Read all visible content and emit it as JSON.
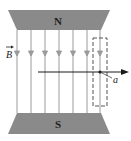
{
  "diagram": {
    "north_pole_label": "N",
    "south_pole_label": "S",
    "field_label": "B",
    "point_label": "a",
    "field_line_count": 7,
    "field_direction": "down",
    "colors": {
      "pole": "#8a8a8a",
      "field_line": "#9a9a9a",
      "arrow": "#1a1a1a",
      "dashed_box": "#555555",
      "text": "#222222"
    }
  }
}
